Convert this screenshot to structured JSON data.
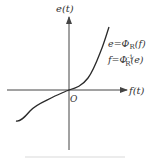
{
  "diagram": {
    "y_axis_label": "e(t)",
    "x_axis_label": "f(t)",
    "origin_label": "O",
    "eq1": {
      "lhs": "e",
      "eq": "=",
      "Phi": "Φ",
      "sub": "R",
      "arg": "(f)"
    },
    "eq2": {
      "lhs": "f",
      "eq": "=",
      "Phi": "Φ",
      "sup": "-1",
      "sub": "R",
      "arg": "(e)"
    },
    "caption": "",
    "colors": {
      "axis": "#444444",
      "curve": "#2a2a2a",
      "text": "#333333"
    }
  }
}
